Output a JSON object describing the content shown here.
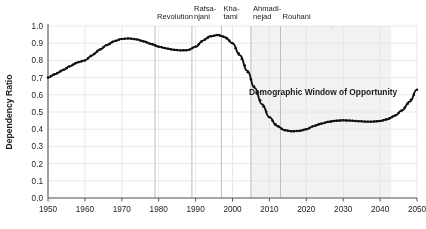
{
  "chart_data": {
    "type": "line",
    "title": "",
    "subtitle": "",
    "xlabel": "",
    "ylabel": "Dependency Ratio",
    "xlim": [
      1950,
      2050
    ],
    "ylim": [
      0.0,
      1.0
    ],
    "grid": true,
    "legend_position": "none",
    "xticks": [
      1950,
      1960,
      1970,
      1980,
      1990,
      2000,
      2010,
      2020,
      2030,
      2040,
      2050
    ],
    "xtick_labels": [
      "1950",
      "1960",
      "1970",
      "1980",
      "1990",
      "2000",
      "2010",
      "2020",
      "2030",
      "2040",
      "2050"
    ],
    "yticks": [
      0.0,
      0.1,
      0.2,
      0.3,
      0.4,
      0.5,
      0.6,
      0.7,
      0.8,
      0.9,
      1.0
    ],
    "ytick_labels": [
      "0.0",
      "0.1",
      "0.2",
      "0.3",
      "0.4",
      "0.5",
      "0.6",
      "0.7",
      "0.8",
      "0.9",
      "1.0"
    ],
    "series": [
      {
        "name": "Dependency Ratio",
        "marker": "dot",
        "color": "#111111",
        "x": [
          1950,
          1952,
          1954,
          1956,
          1958,
          1960,
          1962,
          1964,
          1966,
          1968,
          1970,
          1972,
          1974,
          1976,
          1978,
          1980,
          1982,
          1984,
          1986,
          1988,
          1990,
          1992,
          1994,
          1996,
          1998,
          2000,
          2002,
          2004,
          2006,
          2008,
          2010,
          2012,
          2014,
          2016,
          2018,
          2020,
          2022,
          2024,
          2026,
          2028,
          2030,
          2032,
          2034,
          2036,
          2038,
          2040,
          2042,
          2044,
          2046,
          2048,
          2050
        ],
        "y": [
          0.7,
          0.721,
          0.743,
          0.767,
          0.788,
          0.8,
          0.83,
          0.862,
          0.89,
          0.912,
          0.925,
          0.928,
          0.922,
          0.91,
          0.895,
          0.88,
          0.87,
          0.862,
          0.858,
          0.86,
          0.88,
          0.915,
          0.94,
          0.948,
          0.935,
          0.9,
          0.83,
          0.74,
          0.64,
          0.545,
          0.47,
          0.42,
          0.395,
          0.388,
          0.39,
          0.4,
          0.418,
          0.432,
          0.443,
          0.449,
          0.452,
          0.45,
          0.447,
          0.444,
          0.444,
          0.448,
          0.458,
          0.478,
          0.51,
          0.56,
          0.63
        ]
      }
    ],
    "annotations": [
      {
        "name": "revolution",
        "label": "Revolution",
        "label_lines": [
          "Revolution"
        ],
        "x": 1979
      },
      {
        "name": "rafsanjani",
        "label": "Rafsanjani",
        "label_lines": [
          "Rafsa-",
          "njani"
        ],
        "x": 1989
      },
      {
        "name": "khatami",
        "label": "Khatami",
        "label_lines": [
          "Kha-",
          "tami"
        ],
        "x": 1997
      },
      {
        "name": "ahmadinejad",
        "label": "Ahmadinejad",
        "label_lines": [
          "Ahmadi-",
          "nejad"
        ],
        "x": 2005
      },
      {
        "name": "rouhani",
        "label": "Rouhani",
        "label_lines": [
          "Rouhani"
        ],
        "x": 2013
      }
    ],
    "shaded_regions": [
      {
        "name": "demographic-window",
        "label": "Demographic Window of Opportunity",
        "x_start": 2005,
        "x_end": 2043,
        "color": "#f2f2f2"
      }
    ],
    "colors": {
      "line": "#111111",
      "grid": "#e2e2e2",
      "axis": "#5a5a5a",
      "text": "#1b1b1b",
      "band": "#f2f2f2",
      "event_line": "#bdbdbd",
      "background": "#ffffff"
    }
  }
}
